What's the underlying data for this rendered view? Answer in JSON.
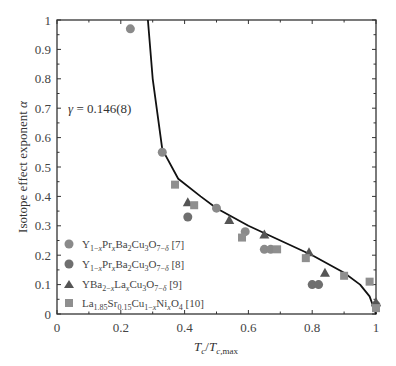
{
  "chart_data": {
    "type": "scatter",
    "title": "",
    "xlabel": "T_c/T_c,max",
    "ylabel": "Isotope effect exponent α",
    "xlim": [
      0,
      1
    ],
    "ylim": [
      0,
      1
    ],
    "xticks": [
      "0",
      "0.2",
      "0.4",
      "0.6",
      "0.8",
      "1"
    ],
    "yticks": [
      "0",
      "0.1",
      "0.2",
      "0.3",
      "0.4",
      "0.5",
      "0.6",
      "0.7",
      "0.8",
      "0.9",
      "1"
    ],
    "grid": false,
    "legend_position": "lower left",
    "annotation": "γ = 0.146(8)",
    "series": [
      {
        "name": "Y1−xPrxBa2Cu3O7−δ [7]",
        "marker": "circle",
        "color": "#8a8a8a",
        "points": [
          [
            0.23,
            0.97
          ],
          [
            0.33,
            0.55
          ],
          [
            0.5,
            0.36
          ],
          [
            0.59,
            0.28
          ],
          [
            0.65,
            0.22
          ],
          [
            0.67,
            0.22
          ]
        ]
      },
      {
        "name": "Y1−xPrxBa2Cu3O7−δ [8]",
        "marker": "circle",
        "color": "#6f6f6f",
        "points": [
          [
            0.41,
            0.33
          ],
          [
            0.8,
            0.1
          ],
          [
            0.82,
            0.1
          ],
          [
            1.0,
            0.03
          ]
        ]
      },
      {
        "name": "YBa2−xLaxCu3O7−δ [9]",
        "marker": "triangle",
        "color": "#555555",
        "points": [
          [
            0.41,
            0.38
          ],
          [
            0.54,
            0.32
          ],
          [
            0.65,
            0.27
          ],
          [
            0.79,
            0.21
          ],
          [
            0.84,
            0.14
          ],
          [
            1.0,
            0.04
          ]
        ]
      },
      {
        "name": "La1.85Sr0.15Cu1−xNixO4 [10]",
        "marker": "square",
        "color": "#8f8f8f",
        "points": [
          [
            0.37,
            0.44
          ],
          [
            0.43,
            0.37
          ],
          [
            0.58,
            0.26
          ],
          [
            0.69,
            0.22
          ],
          [
            0.78,
            0.19
          ],
          [
            0.9,
            0.13
          ],
          [
            0.98,
            0.11
          ],
          [
            1.0,
            0.02
          ]
        ]
      }
    ],
    "fit_curve": {
      "label": "γ = 0.146(8)",
      "points": [
        [
          0.285,
          1.0
        ],
        [
          0.3,
          0.8
        ],
        [
          0.33,
          0.56
        ],
        [
          0.38,
          0.46
        ],
        [
          0.45,
          0.4
        ],
        [
          0.5,
          0.36
        ],
        [
          0.6,
          0.3
        ],
        [
          0.7,
          0.25
        ],
        [
          0.8,
          0.2
        ],
        [
          0.9,
          0.14
        ],
        [
          0.95,
          0.1
        ],
        [
          0.98,
          0.06
        ],
        [
          1.0,
          0.0
        ]
      ]
    }
  },
  "legend": {
    "items": [
      {
        "label_main": "Y",
        "label": "Y1−xPrxBa2Cu3O7−δ [7]"
      },
      {
        "label": "Y1−xPrxBa2Cu3O7−δ [8]"
      },
      {
        "label": "YBa2−xLaxCu3O7−δ [9]"
      },
      {
        "label": "La1.85Sr0.15Cu1−xNixO4 [10]"
      }
    ]
  },
  "annotation_text": "γ = 0.146(8)"
}
